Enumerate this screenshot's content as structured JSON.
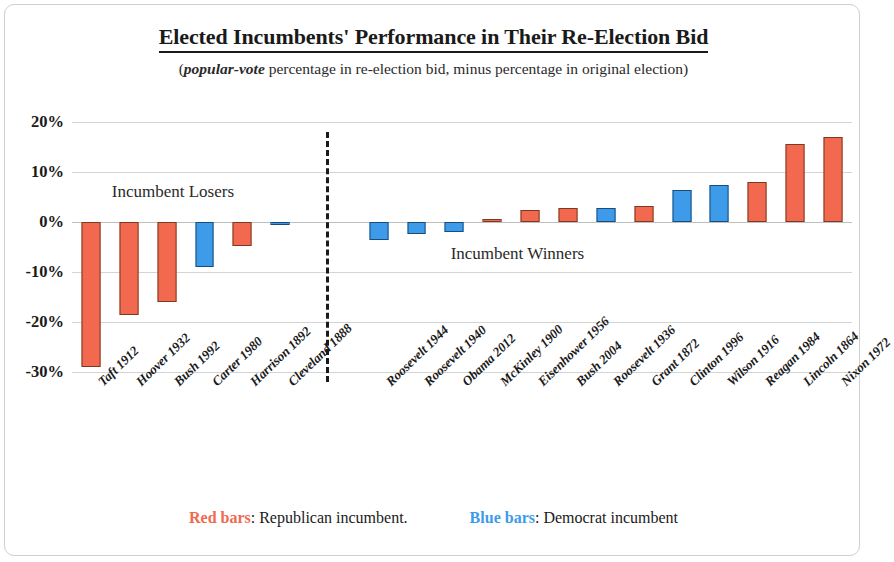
{
  "title": "Elected Incumbents' Performance in Their Re-Election Bid",
  "subtitle_pre": "(",
  "subtitle_em": "popular-vote",
  "subtitle_post": " percentage in re-election bid, minus percentage in original election)",
  "annotations": {
    "losers": "Incumbent Losers",
    "winners": "Incumbent Winners"
  },
  "legend": {
    "red_key": "Red bars",
    "red_text": ":  Republican incumbent.",
    "blue_key": "Blue bars",
    "blue_text": ":  Democrat incumbent"
  },
  "colors": {
    "republican": "#f2694f",
    "democrat": "#3d9bea",
    "gridline": "#d4d4d4",
    "frame": "#cfcfcf",
    "text": "#1a1a1a"
  },
  "chart_data": {
    "type": "bar",
    "title": "Elected Incumbents' Performance in Their Re-Election Bid",
    "subtitle": "(popular-vote percentage in re-election bid, minus percentage in original election)",
    "xlabel": "",
    "ylabel": "",
    "ylim": [
      -30,
      20
    ],
    "yticks": [
      20,
      10,
      0,
      -10,
      -20,
      -30
    ],
    "ytick_labels": [
      "20%",
      "10%",
      "0%",
      "-10%",
      "-20%",
      "-30%"
    ],
    "grid": true,
    "legend_position": "bottom",
    "categories": [
      "Taft 1912",
      "Hoover 1932",
      "Bush 1992",
      "Carter 1980",
      "Harrison 1892",
      "Cleveland 1888",
      "Roosevelt 1944",
      "Roosevelt 1940",
      "Obama 2012",
      "McKinley 1900",
      "Eisenhower 1956",
      "Bush 2004",
      "Roosevelt 1936",
      "Grant 1872",
      "Clinton 1996",
      "Wilson 1916",
      "Reagan 1984",
      "Lincoln 1864",
      "Nixon 1972"
    ],
    "values": [
      -29.0,
      -18.5,
      -16.0,
      -9.0,
      -4.8,
      -0.4,
      -3.6,
      -2.4,
      -2.0,
      0.6,
      2.4,
      2.9,
      2.9,
      3.2,
      6.4,
      7.5,
      8.1,
      15.6,
      17.0
    ],
    "bar_colors": [
      "republican",
      "republican",
      "republican",
      "democrat",
      "republican",
      "democrat",
      "democrat",
      "democrat",
      "democrat",
      "republican",
      "republican",
      "republican",
      "democrat",
      "republican",
      "democrat",
      "democrat",
      "republican",
      "republican",
      "republican"
    ],
    "groups": [
      {
        "name": "Incumbent Losers",
        "start": 0,
        "end": 5
      },
      {
        "name": "Incumbent Winners",
        "start": 6,
        "end": 18
      }
    ],
    "divider_after_index": 5
  }
}
